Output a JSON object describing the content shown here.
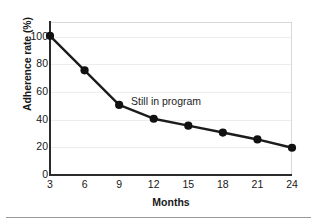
{
  "chart_data": {
    "type": "line",
    "title": "",
    "subtitle": "",
    "xlabel": "Months",
    "ylabel": "Adherence rate (%)",
    "x": [
      3,
      6,
      9,
      12,
      15,
      18,
      21,
      24
    ],
    "xticklabels": [
      "3",
      "6",
      "9",
      "12",
      "15",
      "18",
      "21",
      "24"
    ],
    "yticklabels": [
      "0",
      "20",
      "40",
      "60",
      "80",
      "100"
    ],
    "yticks": [
      0,
      20,
      40,
      60,
      80,
      100
    ],
    "xlim": [
      3,
      24
    ],
    "ylim": [
      0,
      110
    ],
    "grid": "horizontal",
    "legend": "none",
    "series": [
      {
        "name": "Still in program",
        "values": [
          100,
          75,
          50,
          40,
          35,
          30,
          25,
          19
        ],
        "color": "#1c1c1c",
        "marker": "filled-circle",
        "line_width": 2.4
      }
    ],
    "annotations": [
      {
        "text": "Still in program",
        "x": 14.2,
        "y": 52
      }
    ]
  },
  "colors": {
    "background": "#ffffff",
    "line": "#1c1c1c",
    "marker": "#111111",
    "axis": "#2b2b2b",
    "grid": "#ededed",
    "frame": "#d8d8d8",
    "text": "#181818",
    "bottom_rule": "#9a9a9a"
  }
}
